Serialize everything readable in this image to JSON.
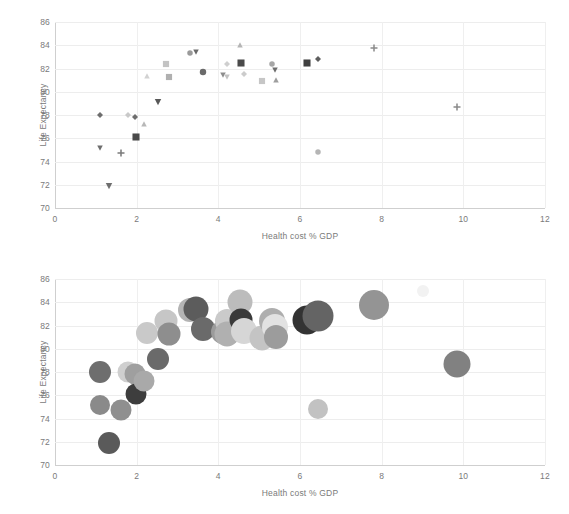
{
  "chart_data": [
    {
      "type": "scatter",
      "panel": "top",
      "title": "",
      "xlabel": "Health cost % GDP",
      "ylabel": "Life Expectancy",
      "xlim": [
        0,
        12
      ],
      "ylim": [
        70,
        86
      ],
      "xticks": [
        0,
        2,
        4,
        6,
        8,
        10,
        12
      ],
      "yticks": [
        70,
        72,
        74,
        76,
        78,
        80,
        82,
        84,
        86
      ],
      "grid": true,
      "legend": "none",
      "points": [
        {
          "x": 1.1,
          "y": 78.0,
          "shape": "diamond",
          "color": "#6e6e6e",
          "size": 6
        },
        {
          "x": 1.1,
          "y": 75.2,
          "shape": "triangle-down",
          "color": "#6e6e6e",
          "size": 6
        },
        {
          "x": 1.32,
          "y": 71.9,
          "shape": "triangle-down",
          "color": "#6e6e6e",
          "size": 7
        },
        {
          "x": 1.62,
          "y": 74.7,
          "shape": "plus",
          "color": "#7b7b7b",
          "size": 7
        },
        {
          "x": 1.78,
          "y": 78.0,
          "shape": "diamond",
          "color": "#c9c9c9",
          "size": 6
        },
        {
          "x": 1.97,
          "y": 77.8,
          "shape": "diamond",
          "color": "#6e6e6e",
          "size": 6
        },
        {
          "x": 1.99,
          "y": 76.1,
          "shape": "square",
          "color": "#4a4a4a",
          "size": 8
        },
        {
          "x": 2.18,
          "y": 77.25,
          "shape": "triangle-up",
          "color": "#b8b8b8",
          "size": 6
        },
        {
          "x": 2.25,
          "y": 81.35,
          "shape": "triangle-up",
          "color": "#d2d2d2",
          "size": 6
        },
        {
          "x": 2.52,
          "y": 79.1,
          "shape": "triangle-down",
          "color": "#585858",
          "size": 7
        },
        {
          "x": 2.72,
          "y": 82.35,
          "shape": "square",
          "color": "#c3c3c3",
          "size": 7
        },
        {
          "x": 2.78,
          "y": 81.25,
          "shape": "square",
          "color": "#b0b0b0",
          "size": 7
        },
        {
          "x": 3.3,
          "y": 83.35,
          "shape": "circle",
          "color": "#9a9a9a",
          "size": 6
        },
        {
          "x": 3.45,
          "y": 83.4,
          "shape": "triangle-down",
          "color": "#6a6a6a",
          "size": 6
        },
        {
          "x": 3.62,
          "y": 81.7,
          "shape": "circle",
          "color": "#6a6a6a",
          "size": 7
        },
        {
          "x": 4.12,
          "y": 81.45,
          "shape": "triangle-down",
          "color": "#8d8d8d",
          "size": 6
        },
        {
          "x": 4.2,
          "y": 82.35,
          "shape": "diamond",
          "color": "#cfcfcf",
          "size": 6
        },
        {
          "x": 4.22,
          "y": 81.3,
          "shape": "triangle-down",
          "color": "#c2c2c2",
          "size": 6
        },
        {
          "x": 4.52,
          "y": 84.0,
          "shape": "triangle-up",
          "color": "#b5b5b5",
          "size": 6
        },
        {
          "x": 4.55,
          "y": 82.5,
          "shape": "square",
          "color": "#4a4a4a",
          "size": 8
        },
        {
          "x": 4.62,
          "y": 81.5,
          "shape": "diamond",
          "color": "#cccccc",
          "size": 6
        },
        {
          "x": 5.08,
          "y": 80.95,
          "shape": "square",
          "color": "#c6c6c6",
          "size": 7
        },
        {
          "x": 5.32,
          "y": 82.4,
          "shape": "circle",
          "color": "#a6a6a6",
          "size": 6
        },
        {
          "x": 5.38,
          "y": 81.85,
          "shape": "triangle-down",
          "color": "#6e6e6e",
          "size": 6
        },
        {
          "x": 5.42,
          "y": 81.05,
          "shape": "triangle-up",
          "color": "#9e9e9e",
          "size": 6
        },
        {
          "x": 6.18,
          "y": 82.5,
          "shape": "square",
          "color": "#3f3f3f",
          "size": 8
        },
        {
          "x": 6.44,
          "y": 82.8,
          "shape": "diamond",
          "color": "#5e5e5e",
          "size": 6
        },
        {
          "x": 6.45,
          "y": 74.8,
          "shape": "circle",
          "color": "#b5b5b5",
          "size": 6
        },
        {
          "x": 7.82,
          "y": 83.8,
          "shape": "plus",
          "color": "#8b8b8b",
          "size": 7
        },
        {
          "x": 9.85,
          "y": 78.65,
          "shape": "plus",
          "color": "#8b8b8b",
          "size": 7
        }
      ]
    },
    {
      "type": "scatter",
      "panel": "bottom",
      "title": "",
      "xlabel": "Health cost % GDP",
      "ylabel": "Life Expectancy",
      "xlim": [
        0,
        12
      ],
      "ylim": [
        70,
        86
      ],
      "xticks": [
        0,
        2,
        4,
        6,
        8,
        10,
        12
      ],
      "yticks": [
        70,
        72,
        74,
        76,
        78,
        80,
        82,
        84,
        86
      ],
      "grid": true,
      "legend": "none",
      "points": [
        {
          "x": 1.1,
          "y": 78.0,
          "shape": "circle",
          "color": "#6e6e6e",
          "size": 22
        },
        {
          "x": 1.1,
          "y": 75.2,
          "shape": "circle",
          "color": "#8a8a8a",
          "size": 20
        },
        {
          "x": 1.32,
          "y": 71.9,
          "shape": "circle",
          "color": "#5a5a5a",
          "size": 22
        },
        {
          "x": 1.62,
          "y": 74.7,
          "shape": "circle",
          "color": "#8f8f8f",
          "size": 21
        },
        {
          "x": 1.78,
          "y": 78.0,
          "shape": "circle",
          "color": "#cfcfcf",
          "size": 21
        },
        {
          "x": 1.97,
          "y": 77.8,
          "shape": "circle",
          "color": "#9f9f9f",
          "size": 21
        },
        {
          "x": 1.99,
          "y": 76.1,
          "shape": "circle",
          "color": "#3d3d3d",
          "size": 21
        },
        {
          "x": 2.18,
          "y": 77.25,
          "shape": "circle",
          "color": "#a9a9a9",
          "size": 21
        },
        {
          "x": 2.25,
          "y": 81.35,
          "shape": "circle",
          "color": "#c9c9c9",
          "size": 22
        },
        {
          "x": 2.52,
          "y": 79.1,
          "shape": "circle",
          "color": "#6a6a6a",
          "size": 22
        },
        {
          "x": 2.72,
          "y": 82.35,
          "shape": "circle",
          "color": "#c6c6c6",
          "size": 23
        },
        {
          "x": 2.78,
          "y": 81.25,
          "shape": "circle",
          "color": "#8e8e8e",
          "size": 23
        },
        {
          "x": 3.3,
          "y": 83.35,
          "shape": "circle",
          "color": "#b4b4b4",
          "size": 24
        },
        {
          "x": 3.45,
          "y": 83.4,
          "shape": "circle",
          "color": "#5c5c5c",
          "size": 25
        },
        {
          "x": 3.62,
          "y": 81.7,
          "shape": "circle",
          "color": "#6a6a6a",
          "size": 24
        },
        {
          "x": 4.12,
          "y": 81.45,
          "shape": "circle",
          "color": "#9b9b9b",
          "size": 24
        },
        {
          "x": 4.2,
          "y": 82.35,
          "shape": "circle",
          "color": "#cacaca",
          "size": 24
        },
        {
          "x": 4.22,
          "y": 81.3,
          "shape": "circle",
          "color": "#b0b0b0",
          "size": 25
        },
        {
          "x": 4.52,
          "y": 84.0,
          "shape": "circle",
          "color": "#bcbcbc",
          "size": 25
        },
        {
          "x": 4.55,
          "y": 82.5,
          "shape": "circle",
          "color": "#3a3a3a",
          "size": 23
        },
        {
          "x": 4.62,
          "y": 81.5,
          "shape": "circle",
          "color": "#d6d6d6",
          "size": 26
        },
        {
          "x": 5.08,
          "y": 80.95,
          "shape": "circle",
          "color": "#c4c4c4",
          "size": 25
        },
        {
          "x": 5.32,
          "y": 82.4,
          "shape": "circle",
          "color": "#aeaeae",
          "size": 26
        },
        {
          "x": 5.38,
          "y": 81.85,
          "shape": "circle",
          "color": "#e2e2e2",
          "size": 26
        },
        {
          "x": 5.42,
          "y": 81.05,
          "shape": "circle",
          "color": "#9c9c9c",
          "size": 24
        },
        {
          "x": 6.18,
          "y": 82.5,
          "shape": "circle",
          "color": "#333333",
          "size": 29
        },
        {
          "x": 6.44,
          "y": 82.8,
          "shape": "circle",
          "color": "#646464",
          "size": 31
        },
        {
          "x": 6.45,
          "y": 74.8,
          "shape": "circle",
          "color": "#c2c2c2",
          "size": 20
        },
        {
          "x": 7.82,
          "y": 83.8,
          "shape": "circle",
          "color": "#949494",
          "size": 30
        },
        {
          "x": 9.0,
          "y": 85.0,
          "shape": "circle",
          "color": "#f2f2f2",
          "size": 12
        },
        {
          "x": 9.85,
          "y": 78.65,
          "shape": "circle",
          "color": "#818181",
          "size": 27
        }
      ]
    }
  ],
  "style": {
    "grid_color": "#ededed",
    "axis_color": "#cfcfcf",
    "text_color": "#7a7a7a",
    "background": "#ffffff"
  }
}
